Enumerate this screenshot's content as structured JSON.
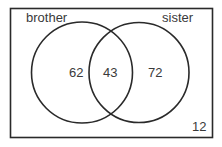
{
  "venn": {
    "sets": [
      {
        "label": "brother",
        "only_count": "62"
      },
      {
        "label": "sister",
        "only_count": "72"
      }
    ],
    "intersection_count": "43",
    "outside_count": "12",
    "colors": {
      "stroke": "#2a2a2a",
      "text": "#3a3a3a",
      "background": "#ffffff"
    }
  }
}
